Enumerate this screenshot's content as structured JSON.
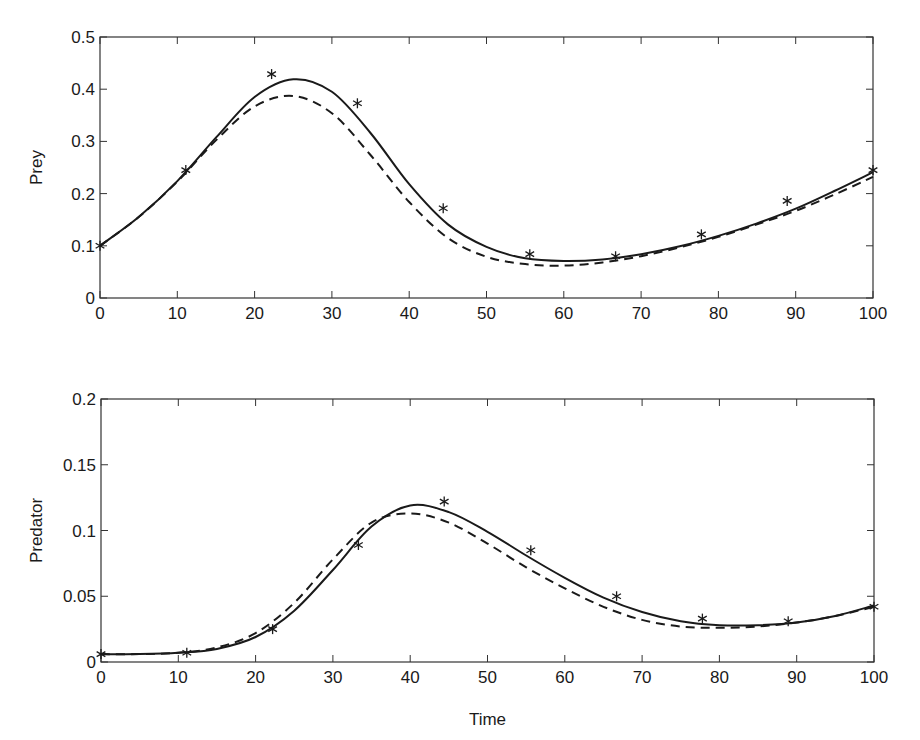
{
  "chart_data": [
    {
      "type": "line",
      "title": "",
      "xlabel": "",
      "ylabel": "Prey",
      "xlim": [
        0,
        100
      ],
      "ylim": [
        0,
        0.5
      ],
      "grid": false,
      "legend": null,
      "x_ticks": [
        "0",
        "10",
        "20",
        "30",
        "40",
        "50",
        "60",
        "70",
        "80",
        "90",
        "100"
      ],
      "y_ticks": [
        "0",
        "0.1",
        "0.2",
        "0.3",
        "0.4",
        "0.5"
      ],
      "x": [
        0,
        5,
        10,
        15,
        20,
        25,
        30,
        35,
        40,
        45,
        50,
        55,
        60,
        65,
        70,
        75,
        80,
        85,
        90,
        95,
        100
      ],
      "series": [
        {
          "name": "solid",
          "style": "solid",
          "values": [
            0.1,
            0.155,
            0.224,
            0.307,
            0.385,
            0.419,
            0.395,
            0.316,
            0.218,
            0.141,
            0.098,
            0.076,
            0.071,
            0.074,
            0.084,
            0.099,
            0.119,
            0.143,
            0.171,
            0.205,
            0.241
          ]
        },
        {
          "name": "dashed",
          "style": "dashed",
          "values": [
            0.1,
            0.155,
            0.223,
            0.302,
            0.367,
            0.387,
            0.354,
            0.274,
            0.184,
            0.115,
            0.079,
            0.065,
            0.062,
            0.068,
            0.08,
            0.097,
            0.117,
            0.141,
            0.167,
            0.198,
            0.232
          ]
        },
        {
          "name": "data",
          "style": "markers",
          "marker": "asterisk",
          "x": [
            0,
            11.1,
            22.2,
            33.3,
            44.4,
            55.6,
            66.7,
            77.8,
            88.9,
            100
          ],
          "values": [
            0.1,
            0.245,
            0.429,
            0.373,
            0.172,
            0.084,
            0.08,
            0.122,
            0.186,
            0.245
          ]
        }
      ]
    },
    {
      "type": "line",
      "title": "",
      "xlabel": "Time",
      "ylabel": "Predator",
      "xlim": [
        0,
        100
      ],
      "ylim": [
        0,
        0.2
      ],
      "grid": false,
      "legend": null,
      "x_ticks": [
        "0",
        "10",
        "20",
        "30",
        "40",
        "50",
        "60",
        "70",
        "80",
        "90",
        "100"
      ],
      "y_ticks": [
        "0",
        "0.05",
        "0.1",
        "0.15",
        "0.2"
      ],
      "x": [
        0,
        5,
        10,
        15,
        20,
        25,
        30,
        35,
        40,
        45,
        50,
        55,
        60,
        65,
        70,
        75,
        80,
        85,
        90,
        95,
        100
      ],
      "series": [
        {
          "name": "solid",
          "style": "solid",
          "values": [
            0.006,
            0.006,
            0.007,
            0.01,
            0.019,
            0.039,
            0.07,
            0.103,
            0.119,
            0.114,
            0.099,
            0.081,
            0.064,
            0.049,
            0.038,
            0.031,
            0.028,
            0.028,
            0.03,
            0.035,
            0.043
          ]
        },
        {
          "name": "dashed",
          "style": "dashed",
          "values": [
            0.006,
            0.006,
            0.007,
            0.011,
            0.022,
            0.045,
            0.078,
            0.106,
            0.113,
            0.106,
            0.09,
            0.072,
            0.056,
            0.042,
            0.032,
            0.027,
            0.026,
            0.027,
            0.03,
            0.035,
            0.042
          ]
        },
        {
          "name": "data",
          "style": "markers",
          "marker": "asterisk",
          "x": [
            0,
            11.1,
            22.2,
            33.3,
            44.4,
            55.6,
            66.7,
            77.8,
            88.9,
            100
          ],
          "values": [
            0.006,
            0.007,
            0.025,
            0.089,
            0.122,
            0.085,
            0.05,
            0.033,
            0.031,
            0.042
          ]
        }
      ]
    }
  ],
  "colors": {
    "axes": "#333333",
    "line": "#1a1a1a",
    "background": "#ffffff"
  }
}
